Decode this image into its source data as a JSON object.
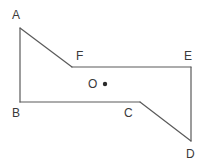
{
  "figure": {
    "type": "polygon-diagram",
    "shape_name": "hexagon ABCDEF",
    "width": 209,
    "height": 168,
    "background_color": "#ffffff",
    "stroke_color": "#5a5a5a",
    "stroke_width": 1.2,
    "label_color": "#3a3a3a",
    "label_font_size": 12,
    "vertices": [
      {
        "name": "A",
        "x": 20,
        "y": 28,
        "label": "A",
        "label_x": 12,
        "label_y": 9
      },
      {
        "name": "B",
        "x": 20,
        "y": 102,
        "label": "B",
        "label_x": 12,
        "label_y": 107
      },
      {
        "name": "C",
        "x": 140,
        "y": 102,
        "label": "C",
        "label_x": 124,
        "label_y": 107
      },
      {
        "name": "D",
        "x": 191,
        "y": 141,
        "label": "D",
        "label_x": 186,
        "label_y": 148
      },
      {
        "name": "E",
        "x": 191,
        "y": 67,
        "label": "E",
        "label_x": 184,
        "label_y": 50
      },
      {
        "name": "F",
        "x": 72,
        "y": 67,
        "label": "F",
        "label_x": 76,
        "label_y": 50
      }
    ],
    "edges": [
      {
        "from": "A",
        "to": "F",
        "name": "edge-af"
      },
      {
        "from": "F",
        "to": "E",
        "name": "edge-fe"
      },
      {
        "from": "E",
        "to": "D",
        "name": "edge-ed"
      },
      {
        "from": "D",
        "to": "C",
        "name": "edge-dc"
      },
      {
        "from": "C",
        "to": "B",
        "name": "edge-cb"
      },
      {
        "from": "B",
        "to": "A",
        "name": "edge-ba"
      }
    ],
    "interior_point": {
      "name": "O",
      "label": "O",
      "label_x": 88,
      "label_y": 78,
      "dot_x": 105,
      "dot_y": 84,
      "dot_radius": 2.2,
      "dot_color": "#2a2a2a"
    },
    "polygon_points": "20,28 72,67 191,67 191,141 140,102 20,102"
  }
}
